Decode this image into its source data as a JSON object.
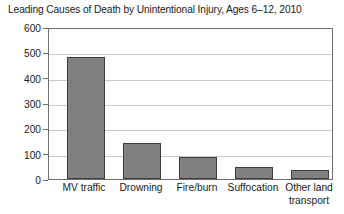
{
  "chart_data": {
    "type": "bar",
    "title": "Leading Causes of Death by Unintentional Injury, Ages 6–12, 2010",
    "xlabel": "",
    "ylabel": "",
    "categories": [
      "MV traffic",
      "Drowning",
      "Fire/burn",
      "Suffocation",
      "Other land transport"
    ],
    "values": [
      487,
      145,
      90,
      50,
      35
    ],
    "ylim": [
      0,
      600
    ],
    "yticks": [
      0,
      100,
      200,
      300,
      400,
      500,
      600
    ],
    "ytick_labels": [
      "0",
      "100",
      "200",
      "300",
      "400",
      "500",
      "600"
    ],
    "grid": true,
    "grid_axis": "y",
    "legend": false,
    "bar_color": "#808080",
    "bar_edge_color": "#3d3d3d",
    "frame_color": "#6e6e6e",
    "gridline_color": "#c9c9c9",
    "background": "#ffffff"
  },
  "labels": {
    "cat_0_line_0": "MV traffic",
    "cat_0_line_1": "",
    "cat_1_line_0": "Drowning",
    "cat_1_line_1": "",
    "cat_2_line_0": "Fire/burn",
    "cat_2_line_1": "",
    "cat_3_line_0": "Suffocation",
    "cat_3_line_1": "",
    "cat_4_line_0": "Other land",
    "cat_4_line_1": "transport"
  }
}
